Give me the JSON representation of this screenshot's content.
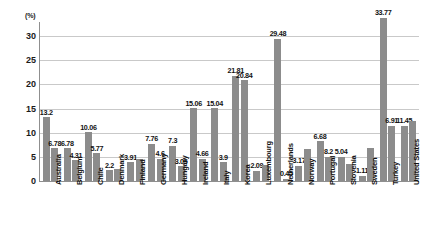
{
  "chart_data": {
    "type": "bar",
    "title": "",
    "xlabel": "",
    "ylabel": "(%)",
    "unit_label": "(%)",
    "ylim": [
      0,
      32.5
    ],
    "yticks": [
      0,
      5,
      10,
      15,
      20,
      25,
      30
    ],
    "grid": true,
    "legend": "none",
    "categories": [
      "Australia",
      "Belgium",
      "Chile",
      "Denmark",
      "Finland",
      "Germany",
      "Hungary",
      "Ireland",
      "Italy",
      "Korea",
      "Luxembourg",
      "Netherlands",
      "Norway",
      "Portugal",
      "Slovenia",
      "Sweden",
      "Turkey",
      "United States"
    ],
    "series": [
      {
        "name": "Series 1",
        "values": [
          13.2,
          6.78,
          10.06,
          2.2,
          3.91,
          7.76,
          7.3,
          15.06,
          15.04,
          21.81,
          2.09,
          29.48,
          3.17,
          8.2,
          5.04,
          1.11,
          33.77,
          11.45
        ]
      },
      {
        "name": "Series 2",
        "values": [
          6.78,
          4.31,
          5.77,
          2.2,
          4.6,
          4.6,
          3.05,
          4.66,
          3.9,
          20.84,
          2.09,
          0.45,
          6.68,
          5.04,
          3.17,
          1.11,
          6.91,
          11.45
        ]
      }
    ],
    "bar_labels": [
      [
        "13.2",
        "6.78"
      ],
      [
        "6.78",
        "4.31"
      ],
      [
        "10.06",
        "5.77"
      ],
      [
        "2.2",
        ""
      ],
      [
        "3.91",
        ""
      ],
      [
        "7.76",
        "4.6"
      ],
      [
        "7.3",
        "3.05"
      ],
      [
        "15.06",
        "4.66"
      ],
      [
        "15.04",
        "3.9"
      ],
      [
        "21.81",
        "20.84"
      ],
      [
        "2.09",
        ""
      ],
      [
        "29.48",
        "0.45"
      ],
      [
        "3.17",
        ""
      ],
      [
        "6.68",
        "8.2"
      ],
      [
        "5.04",
        ""
      ],
      [
        "1.11",
        ""
      ],
      [
        "33.77",
        "6.91"
      ],
      [
        "11.45",
        ""
      ]
    ],
    "bar_heights": [
      [
        13.2,
        6.78
      ],
      [
        6.78,
        4.31
      ],
      [
        10.06,
        5.77
      ],
      [
        2.2,
        2.5
      ],
      [
        3.91,
        4.6
      ],
      [
        7.76,
        4.6
      ],
      [
        7.3,
        3.05
      ],
      [
        15.06,
        4.66
      ],
      [
        15.04,
        3.9
      ],
      [
        21.81,
        20.84
      ],
      [
        2.09,
        3.3
      ],
      [
        29.48,
        0.45
      ],
      [
        3.17,
        6.68
      ],
      [
        8.2,
        5.04
      ],
      [
        5.04,
        3.6
      ],
      [
        1.11,
        6.91
      ],
      [
        33.77,
        11.45
      ],
      [
        11.45,
        12.4
      ]
    ],
    "colors": {
      "bar": "#8c8c8c",
      "grid": "#c9c9c9",
      "axis": "#8f8f8f",
      "text": "#111111",
      "background": "#ffffff"
    }
  }
}
